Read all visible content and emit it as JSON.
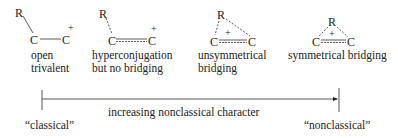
{
  "structures": [
    {
      "id": "open-trivalent",
      "atoms": {
        "r": "R",
        "c_left": "C",
        "c_right": "C"
      },
      "charge": "+",
      "label_lines": [
        "open",
        "trivalent"
      ]
    },
    {
      "id": "hyperconjugation",
      "atoms": {
        "r": "R",
        "c_left": "C",
        "c_right": "C"
      },
      "charge": "+",
      "label_lines": [
        "hyperconjugation",
        "but no bridging"
      ]
    },
    {
      "id": "unsymmetrical-bridging",
      "atoms": {
        "r": "R",
        "c_left": "C",
        "c_right": "C"
      },
      "charge": "+",
      "label_lines": [
        "unsymmetrical",
        "bridging"
      ]
    },
    {
      "id": "symmetrical-bridging",
      "atoms": {
        "r": "R",
        "c_left": "C",
        "c_right": "C"
      },
      "charge": "+",
      "label_lines": [
        "symmetrical bridging"
      ]
    }
  ],
  "scale": {
    "axis_label": "increasing nonclassical character",
    "left_label": "“classical”",
    "right_label": "“nonclassical”"
  },
  "colors": {
    "ink": "#222222",
    "background": "#ffffff"
  }
}
